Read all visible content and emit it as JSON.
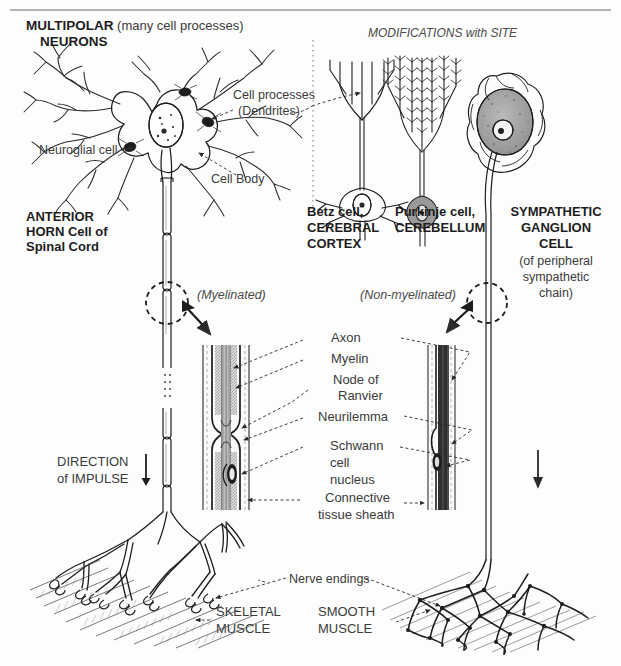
{
  "figure": {
    "title_bold": "MULTIPOLAR",
    "title_rest": " (many cell processes)",
    "title_line2": "NEURONS",
    "modifications_heading": "MODIFICATIONS with SITE"
  },
  "left_neuron": {
    "callout_cell_processes_l1": "Cell processes",
    "callout_cell_processes_l2": "(Dendrites)",
    "callout_neuroglial": "Neuroglial cell",
    "callout_cell_body": "Cell Body",
    "site_l1": "ANTERIOR",
    "site_l2": "HORN Cell of",
    "site_l3": "Spinal Cord",
    "myelination": "(Myelinated)",
    "direction_l1": "DIRECTION",
    "direction_l2": "of IMPULSE",
    "direction_arrow": "down-arrow-icon"
  },
  "modifications": [
    {
      "name": "betz-cell",
      "label_l1": "Betz cell,",
      "label_l2": "CEREBRAL",
      "label_l3": "CORTEX"
    },
    {
      "name": "purkinje-cell",
      "label_l1": "Purkinje cell,",
      "label_l2": "CEREBELLUM",
      "label_l3": ""
    }
  ],
  "right_neuron": {
    "site_l1": "SYMPATHETIC",
    "site_l2": "GANGLION",
    "site_l3": "CELL",
    "sub_l1": "(of peripheral",
    "sub_l2": "sympathetic",
    "sub_l3": "chain)",
    "myelination": "(Non-myelinated)",
    "direction_arrow": "down-arrow-icon"
  },
  "axon_detail_labels": {
    "axon": "Axon",
    "myelin": "Myelin",
    "node_l1": "Node of",
    "node_l2": "Ranvier",
    "neurilemma": "Neurilemma",
    "schwann_l1": "Schwann",
    "schwann_l2": "cell",
    "schwann_l3": "nucleus",
    "connective_l1": "Connective",
    "connective_l2": "tissue sheath"
  },
  "endings": {
    "nerve_endings": "Nerve endings",
    "skeletal_l1": "SKELETAL",
    "skeletal_l2": "MUSCLE",
    "smooth_l1": "SMOOTH",
    "smooth_l2": "MUSCLE"
  },
  "colors": {
    "ink": "#1d1d1d",
    "text": "#3b3b3b",
    "rule": "#9b9b9b",
    "background": "#fdfdfd"
  }
}
